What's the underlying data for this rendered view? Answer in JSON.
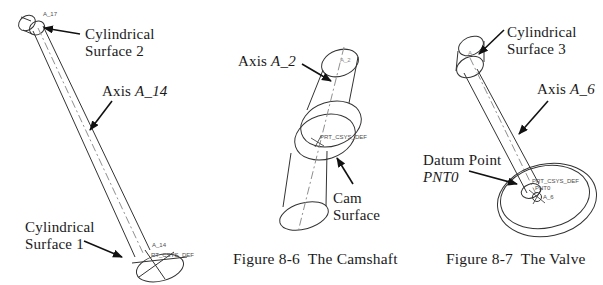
{
  "colors": {
    "line": "#333333",
    "centerline": "#8f8f8f",
    "arrow": "#111111",
    "tag_text": "#4d4d4d",
    "background": "#ffffff"
  },
  "pushrod": {
    "surface2_label": "Cylindrical\nSurface 2",
    "axis_label_prefix": "Axis ",
    "axis_label_name": "A_14",
    "surface1_label": "Cylindrical\nSurface 1",
    "tag_top_axis": "A_17",
    "tag_bottom_axis": "A_14",
    "tag_csys": "RT_CSYS_DEF"
  },
  "camshaft": {
    "axis_label_prefix": "Axis ",
    "axis_label_name": "A_2",
    "cam_label": "Cam\nSurface",
    "tag_axis": "A_2",
    "tag_csys": "PRT_CSYS_DEF",
    "caption": "Figure 8-6  The Camshaft"
  },
  "valve": {
    "surface3_label": "Cylindrical\nSurface 3",
    "axis_label_prefix": "Axis ",
    "axis_label_name": "A_6",
    "datum_label": "Datum Point",
    "datum_name": "PNT0",
    "tag_stem_axis": "A",
    "tag_csys": "PRT_CSYS_DEF",
    "tag_pnt": "PNT0",
    "tag_axis": "A_6",
    "caption": "Figure 8-7  The Valve"
  }
}
